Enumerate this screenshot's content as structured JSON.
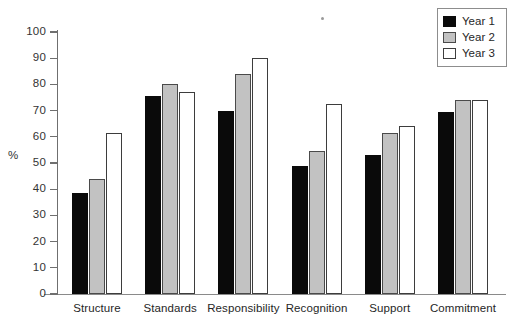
{
  "chart_data": {
    "type": "bar",
    "title": "",
    "subtitle": "",
    "xlabel": "",
    "ylabel": "%",
    "ylim": [
      0,
      100
    ],
    "ytick_step": 10,
    "yticks": [
      100,
      90,
      80,
      70,
      60,
      50,
      40,
      30,
      20,
      10,
      0
    ],
    "grid": false,
    "legend_position": "top-right",
    "categories": [
      "Structure",
      "Standards",
      "Responsibility",
      "Recognition",
      "Support",
      "Commitment"
    ],
    "series": [
      {
        "name": "Year 1",
        "color": "#0a0a0a",
        "values": [
          38.5,
          75.5,
          70.0,
          49.0,
          53.0,
          69.5
        ]
      },
      {
        "name": "Year 2",
        "color": "#c2c2c2",
        "values": [
          44.0,
          80.0,
          84.0,
          54.5,
          61.5,
          74.0
        ]
      },
      {
        "name": "Year 3",
        "color": "#ffffff",
        "values": [
          61.5,
          77.0,
          90.0,
          72.5,
          64.0,
          74.0
        ]
      }
    ]
  },
  "legend": {
    "items": [
      {
        "label": "Year 1"
      },
      {
        "label": "Year 2"
      },
      {
        "label": "Year 3"
      }
    ]
  }
}
